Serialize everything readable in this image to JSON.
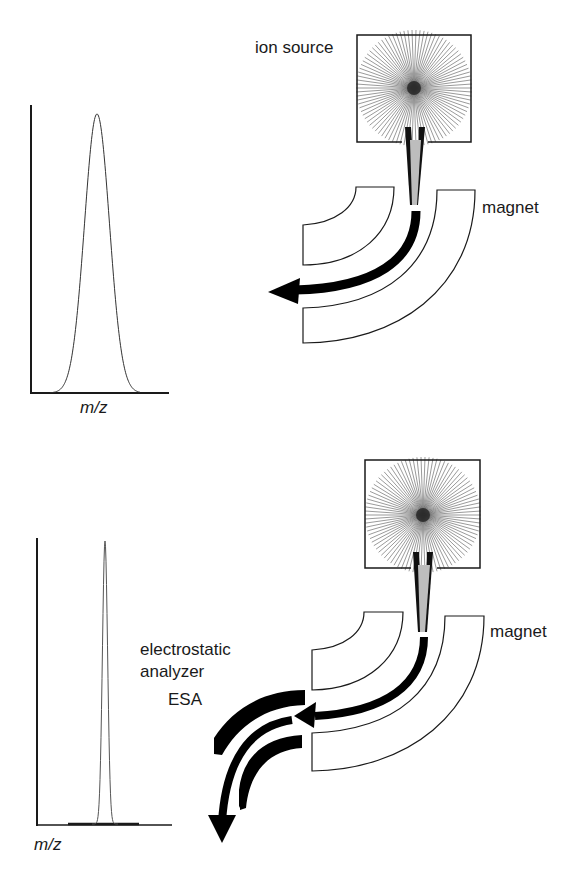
{
  "panels": [
    {
      "id": "single-focusing",
      "ion_source_label": "ion source",
      "magnet_label": "magnet",
      "spectrum": {
        "xlabel": "m/z",
        "peak_shape": "broad"
      }
    },
    {
      "id": "double-focusing",
      "magnet_label": "magnet",
      "esa_label_line1": "electrostatic",
      "esa_label_line2": "analyzer",
      "esa_abbrev": "ESA",
      "spectrum": {
        "xlabel": "m/z",
        "peak_shape": "narrow"
      }
    }
  ],
  "colors": {
    "line": "#1a1a1a",
    "beam": "#000000",
    "beam_unfocused": "#bdbdbd",
    "background": "#ffffff"
  }
}
